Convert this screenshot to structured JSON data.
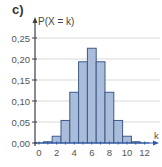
{
  "part_label": "c)",
  "chart_data": {
    "type": "bar",
    "title": "",
    "xlabel": "k",
    "ylabel": "P(X = k)",
    "categories": [
      0,
      1,
      2,
      3,
      4,
      5,
      6,
      7,
      8,
      9,
      10,
      11,
      12
    ],
    "values": [
      0.0002,
      0.0029,
      0.0161,
      0.0537,
      0.1208,
      0.1934,
      0.2256,
      0.1934,
      0.1208,
      0.0537,
      0.0161,
      0.0029,
      0.0002
    ],
    "ylim": [
      0,
      0.25
    ],
    "yticks": [
      "0,00",
      "0,05",
      "0,10",
      "0,15",
      "0,20",
      "0,25"
    ],
    "ytick_values": [
      0,
      0.05,
      0.1,
      0.15,
      0.2,
      0.25
    ],
    "xticks": [
      "0",
      "2",
      "4",
      "6",
      "8",
      "10",
      "12"
    ],
    "xtick_values": [
      0,
      2,
      4,
      6,
      8,
      10,
      12
    ],
    "grid": true,
    "colors": {
      "bar_fill": "#a9bcd9",
      "bar_edge": "#3d5a8a",
      "axis": "#3a3f4a",
      "grid": "#d9d9d9",
      "axis_arrow": "#2e5aa8"
    }
  }
}
